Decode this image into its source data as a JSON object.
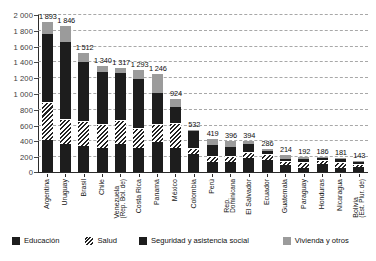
{
  "chart_data": {
    "type": "bar",
    "subtype": "stacked-bar",
    "title": "",
    "xlabel": "",
    "ylabel": "",
    "ylim": [
      0,
      2000
    ],
    "yticks": [
      "0",
      "200",
      "400",
      "600",
      "800",
      "1 000",
      "1 200",
      "1 400",
      "1 600",
      "1 800",
      "2 000"
    ],
    "grid": true,
    "legend_position": "bottom",
    "categories": [
      "Argentina",
      "Uruguay",
      "Brasil",
      "Chile",
      "Venezuela (Rep. Bol. de)",
      "Costa Rica",
      "Panamá",
      "México",
      "Colombia",
      "Perú",
      "Rep. Dominicana",
      "El Salvador",
      "Ecuador",
      "Guatemala",
      "Paraguay",
      "Honduras",
      "Nicaragua",
      "Bolivia (Est. Plur. de)"
    ],
    "totals": [
      1893,
      1846,
      1512,
      1340,
      1317,
      1293,
      1246,
      924,
      532,
      419,
      396,
      394,
      286,
      214,
      192,
      186,
      181,
      143
    ],
    "series": [
      {
        "name": "Educación",
        "color": "#1d1d1d",
        "values": [
          400,
          355,
          330,
          300,
          355,
          300,
          375,
          310,
          230,
          130,
          130,
          175,
          150,
          90,
          55,
          100,
          50,
          60
        ]
      },
      {
        "name": "Salud",
        "color": "#hatch",
        "values": [
          470,
          300,
          300,
          290,
          285,
          250,
          215,
          300,
          60,
          65,
          55,
          70,
          65,
          35,
          65,
          40,
          65,
          30
        ]
      },
      {
        "name": "Seguridad y asistencia social",
        "color": "#1d1d1d",
        "values": [
          880,
          990,
          760,
          680,
          615,
          630,
          410,
          210,
          235,
          150,
          130,
          110,
          50,
          45,
          40,
          35,
          45,
          40
        ]
      },
      {
        "name": "Vivienda y otros",
        "color": "#9b9b9b",
        "values": [
          143,
          201,
          122,
          70,
          62,
          113,
          246,
          104,
          7,
          74,
          81,
          39,
          21,
          44,
          32,
          11,
          21,
          13
        ]
      }
    ]
  },
  "axis": {
    "y": {
      "ticks": [
        {
          "label": "2 000",
          "value": 2000
        },
        {
          "label": "1 800",
          "value": 1800
        },
        {
          "label": "1 600",
          "value": 1600
        },
        {
          "label": "1 400",
          "value": 1400
        },
        {
          "label": "1 200",
          "value": 1200
        },
        {
          "label": "1 000",
          "value": 1000
        },
        {
          "label": "800",
          "value": 800
        },
        {
          "label": "600",
          "value": 600
        },
        {
          "label": "400",
          "value": 400
        },
        {
          "label": "200",
          "value": 200
        },
        {
          "label": "0",
          "value": 0
        }
      ]
    }
  },
  "bars": [
    {
      "name": "Argentina",
      "label_main": "Argentina",
      "label_sub": "",
      "value_label": "1 893"
    },
    {
      "name": "Uruguay",
      "label_main": "Uruguay",
      "label_sub": "",
      "value_label": "1 846"
    },
    {
      "name": "Brasil",
      "label_main": "Brasil",
      "label_sub": "",
      "value_label": "1 512"
    },
    {
      "name": "Chile",
      "label_main": "Chile",
      "label_sub": "",
      "value_label": "1 340"
    },
    {
      "name": "Venezuela",
      "label_main": "Venezuela",
      "label_sub": "(Rep. Bol. de)",
      "value_label": "1 317"
    },
    {
      "name": "Costa Rica",
      "label_main": "Costa Rica",
      "label_sub": "",
      "value_label": "1 293"
    },
    {
      "name": "Panamá",
      "label_main": "Panamá",
      "label_sub": "",
      "value_label": "1 246"
    },
    {
      "name": "México",
      "label_main": "México",
      "label_sub": "",
      "value_label": "924"
    },
    {
      "name": "Colombia",
      "label_main": "Colombia",
      "label_sub": "",
      "value_label": "532"
    },
    {
      "name": "Perú",
      "label_main": "Perú",
      "label_sub": "",
      "value_label": "419"
    },
    {
      "name": "Rep. Dominicana",
      "label_main": "Rep.",
      "label_sub": "Dominicana",
      "value_label": "396"
    },
    {
      "name": "El Salvador",
      "label_main": "El Salvador",
      "label_sub": "",
      "value_label": "394"
    },
    {
      "name": "Ecuador",
      "label_main": "Ecuador",
      "label_sub": "",
      "value_label": "286"
    },
    {
      "name": "Guatemala",
      "label_main": "Guatemala",
      "label_sub": "",
      "value_label": "214"
    },
    {
      "name": "Paraguay",
      "label_main": "Paraguay",
      "label_sub": "",
      "value_label": "192"
    },
    {
      "name": "Honduras",
      "label_main": "Honduras",
      "label_sub": "",
      "value_label": "186"
    },
    {
      "name": "Nicaragua",
      "label_main": "Nicaragua",
      "label_sub": "",
      "value_label": "181"
    },
    {
      "name": "Bolivia",
      "label_main": "Bolivia",
      "label_sub": "(Est. Plur. de)",
      "value_label": "143"
    }
  ],
  "legend": {
    "items": [
      {
        "key": "educacion",
        "label": "Educación"
      },
      {
        "key": "salud",
        "label": "Salud"
      },
      {
        "key": "seguridad",
        "label": "Seguridad y asistencia social"
      },
      {
        "key": "vivienda",
        "label": "Vivienda y otros"
      }
    ]
  },
  "colors": {
    "dark": "#1d1d1d",
    "gray": "#9b9b9b",
    "grid": "#9a9a9a",
    "axis": "#2b2b2b",
    "background": "#ffffff"
  }
}
